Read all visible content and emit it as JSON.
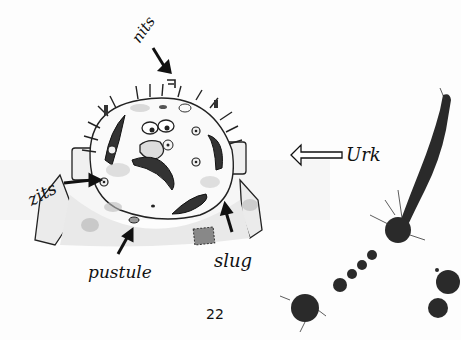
{
  "page": {
    "number": "22",
    "background": "#fdfdfd",
    "ink_color": "#1a1a1a"
  },
  "illustration": {
    "subject": "cartoon monster face",
    "labels": {
      "nits": "nits",
      "zits": "zits",
      "pustule": "pustule",
      "slug": "slug",
      "urk": "Urk"
    }
  }
}
